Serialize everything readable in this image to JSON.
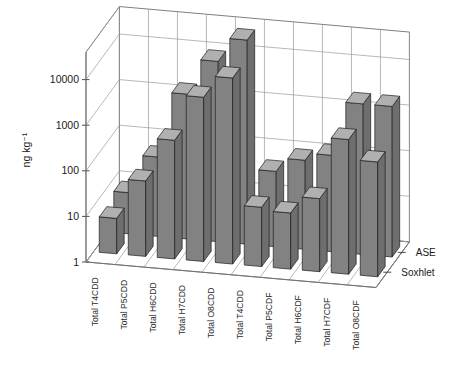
{
  "chart_data": {
    "type": "bar",
    "title": "",
    "subtitle": "",
    "xlabel": "",
    "ylabel": "ng kg⁻¹",
    "yscale": "log",
    "ylim": [
      1,
      40000
    ],
    "ytick_labels": [
      "1",
      "10",
      "100",
      "1000",
      "10000"
    ],
    "ytick_values": [
      1,
      10,
      100,
      1000,
      10000
    ],
    "grid": true,
    "legend_position": "right",
    "projection": "3d-bars",
    "categories": [
      "Total T4CDD",
      "Total P5CDD",
      "Total H6CDD",
      "Total H7CDD",
      "Total O8CDD",
      "Total T4CDD",
      "Total P5CDF",
      "Total H6CDF",
      "Total H7CDF",
      "Total O8CDF"
    ],
    "series": [
      {
        "name": "ASE",
        "row": "back",
        "values": [
          8,
          55,
          1500,
          9000,
          30000,
          45,
          90,
          130,
          2000,
          2000
        ]
      },
      {
        "name": "Soxhlet",
        "row": "front",
        "values": [
          6,
          45,
          400,
          4000,
          12000,
          20,
          17,
          40,
          900,
          330
        ]
      }
    ]
  },
  "axes": {
    "y_title": "ng kg⁻¹",
    "y_ticks": [
      "10000",
      "1000",
      "100",
      "10",
      "1"
    ]
  },
  "legend": {
    "entries": [
      {
        "label": "ASE"
      },
      {
        "label": "Soxhlet"
      }
    ]
  }
}
